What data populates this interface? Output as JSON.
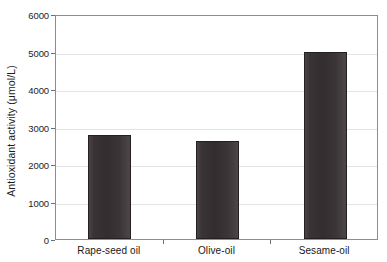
{
  "chart_data": {
    "type": "bar",
    "title": "",
    "subtitle": "",
    "xlabel": "",
    "ylabel": "Antioxidant activity (μmol/L)",
    "categories": [
      "Rape-seed oil",
      "Olive-oil",
      "Sesame-oil"
    ],
    "values": [
      2780,
      2620,
      5000
    ],
    "series": [
      {
        "name": "Antioxidant activity",
        "values": [
          2780,
          2620,
          5000
        ]
      }
    ],
    "ylim": [
      0,
      6000
    ],
    "yticks": [
      0,
      1000,
      2000,
      3000,
      4000,
      5000,
      6000
    ],
    "ytick_labels": [
      "0",
      "1000",
      "2000",
      "3000",
      "4000",
      "5000",
      "6000"
    ],
    "grid": "horizontal",
    "legend": "none",
    "bar_color": "#3a3336",
    "axis_color": "#8d8d8d",
    "gridline_color": "#e4e4e4",
    "background": "#ffffff"
  }
}
